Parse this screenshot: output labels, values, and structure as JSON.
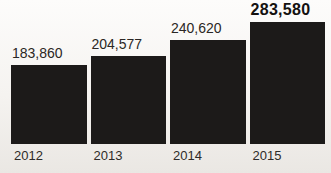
{
  "chart_data": {
    "type": "bar",
    "title": "",
    "xlabel": "",
    "ylabel": "",
    "categories": [
      "2012",
      "2013",
      "2014",
      "2015"
    ],
    "values": [
      183860,
      204577,
      240620,
      283580
    ],
    "value_labels": [
      "183,860",
      "204,577",
      "240,620",
      "283,580"
    ],
    "emphasized_index": 3,
    "ylim": [
      0,
      283580
    ],
    "grid": false,
    "legend": false,
    "axis_lines": false,
    "colors": {
      "bar": "#1c1a19",
      "value_label": "#2b2724",
      "emphasized_value_label": "#141110",
      "year_label": "#2e2b28",
      "background_top": "#fdfcfb",
      "background_bottom": "#eae7e3"
    }
  }
}
